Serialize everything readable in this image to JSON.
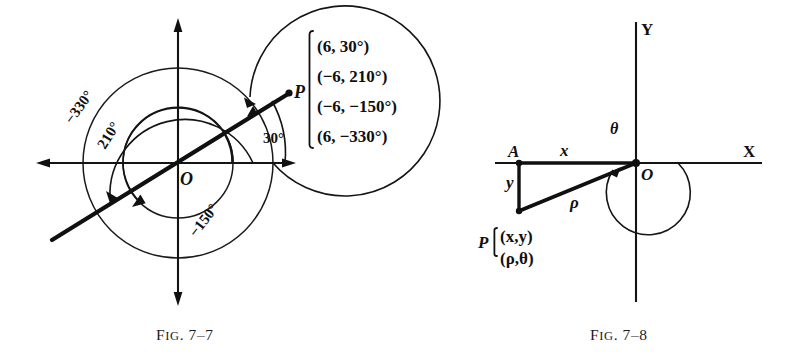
{
  "figures": [
    {
      "id": "fig-7-7",
      "caption_prefix": "F",
      "caption_ig": "IG",
      "caption_dot": ".",
      "caption_number": "7–7",
      "caption_full": "FIG. 7–7",
      "point_label": "P",
      "origin_label": "O",
      "angle_labels": {
        "a30": "30°",
        "a210": "210°",
        "a_neg150": "−150°",
        "a_neg330": "−330°"
      },
      "coordinate_list": [
        "(6, 30°)",
        "(−6, 210°)",
        "(−6, −150°)",
        "(6, −330°)"
      ]
    },
    {
      "id": "fig-7-8",
      "caption_full": "FIG. 7–8",
      "caption_number": "7–8",
      "axis_x_label": "X",
      "axis_y_label": "Y",
      "origin_label": "O",
      "point_a_label": "A",
      "point_p_label": "P",
      "leg_x_label": "x",
      "leg_y_label": "y",
      "rho_label": "ρ",
      "theta_label": "θ",
      "coordinate_list": [
        "(x,y)",
        "(ρ,θ)"
      ]
    }
  ],
  "colors": {
    "ink": "#101010",
    "paper": "#ffffff",
    "rule": "#1a1a1a"
  }
}
